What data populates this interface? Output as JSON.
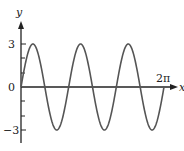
{
  "chart_data": {
    "type": "line",
    "title": "",
    "function": "y = 3 sin(3x)",
    "xlabel": "x",
    "ylabel": "y",
    "xlim": [
      0,
      6.2832
    ],
    "ylim": [
      -3,
      3
    ],
    "x_tick_labels": [
      "2π"
    ],
    "y_tick_labels": [
      "3",
      "0",
      "−3"
    ],
    "y_minor_ticks": [
      -2,
      -1,
      1,
      2
    ],
    "grid": false,
    "legend": null,
    "series": [
      {
        "name": "3 sin 3x",
        "amplitude": 3,
        "periods": 3,
        "x": [
          0,
          0.5236,
          1.0472,
          1.5708,
          2.0944,
          2.618,
          3.1416,
          3.6652,
          4.1888,
          4.7124,
          5.236,
          5.7596,
          6.2832
        ],
        "values": [
          0,
          3,
          0,
          -3,
          0,
          3,
          0,
          -3,
          0,
          3,
          0,
          -3,
          0
        ]
      }
    ]
  },
  "labels": {
    "y_axis": "y",
    "x_axis": "x",
    "y_max": "3",
    "origin": "0",
    "y_min": "−3",
    "x_end": "2π"
  }
}
